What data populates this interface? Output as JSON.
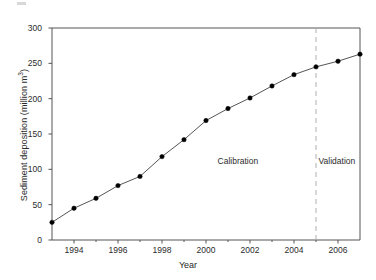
{
  "chart_data": {
    "type": "line",
    "title": "",
    "subtitle": "",
    "xlabel": "Year",
    "ylabel": "Sediment deposition (million m3)",
    "ylabel_base": "Sediment deposition (million m",
    "ylabel_sup": "3",
    "ylabel_tail": ")",
    "xlim": [
      1993,
      2007
    ],
    "ylim": [
      0,
      300
    ],
    "grid": false,
    "legend": null,
    "x": [
      1993,
      1994,
      1995,
      1996,
      1997,
      1998,
      1999,
      2000,
      2001,
      2002,
      2003,
      2004,
      2005,
      2006,
      2007
    ],
    "values": [
      25,
      45,
      59,
      77,
      90,
      118,
      142,
      169,
      186,
      201,
      218,
      234,
      245,
      253,
      263
    ],
    "series": [
      {
        "name": "Sediment deposition",
        "values": [
          25,
          45,
          59,
          77,
          90,
          118,
          142,
          169,
          186,
          201,
          218,
          234,
          245,
          253,
          263
        ]
      }
    ],
    "ytick_labels": [
      "0",
      "50",
      "100",
      "150",
      "200",
      "250",
      "300"
    ],
    "ytick_values": [
      0,
      50,
      100,
      150,
      200,
      250,
      300
    ],
    "xtick_labels": [
      "1994",
      "1996",
      "1998",
      "2000",
      "2002",
      "2004",
      "2006"
    ],
    "xtick_values": [
      1994,
      1996,
      1998,
      2000,
      2002,
      2004,
      2006
    ],
    "xminor_values": [
      1993,
      1995,
      1997,
      1999,
      2001,
      2003,
      2005,
      2007
    ],
    "annotations": [
      {
        "label": "Calibration",
        "x": 2001.45,
        "y": 110
      },
      {
        "label": "Validation",
        "x": 2005.95,
        "y": 110
      }
    ],
    "reference_line": {
      "x": 2005,
      "style": "dashed",
      "color": "#b0b0b0"
    },
    "marker": {
      "shape": "circle",
      "color": "#000000",
      "size": 3.6
    },
    "line": {
      "color": "#555555",
      "width": 1
    }
  },
  "colors": {
    "axis": "#555555",
    "marker": "#000000",
    "line": "#555555",
    "divider": "#b0b0b0",
    "text": "#2b2b2b",
    "background": "#ffffff"
  }
}
